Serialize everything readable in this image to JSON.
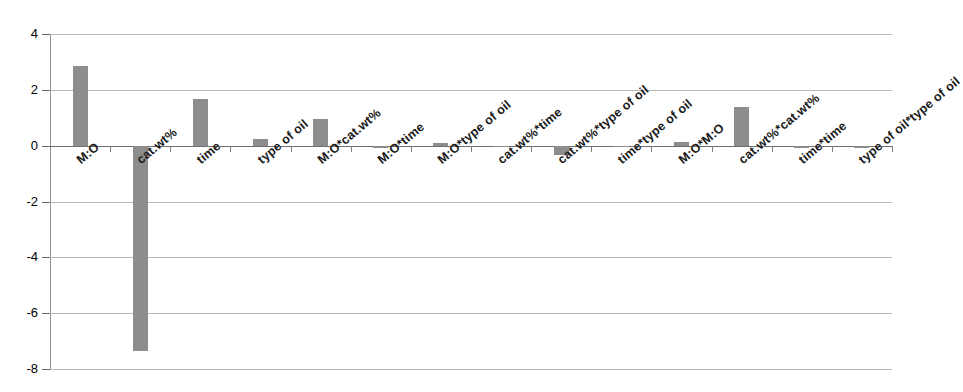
{
  "chart_data": {
    "type": "bar",
    "title": "",
    "subtitle": "",
    "xlabel": "",
    "ylabel": "",
    "ylim": [
      -8,
      4
    ],
    "yticks": [
      4,
      2,
      0,
      -2,
      -4,
      -6,
      -8
    ],
    "ytick_labels": [
      "4",
      "2",
      "0",
      "-2",
      "-4",
      "-6",
      "-8"
    ],
    "grid": true,
    "legend": false,
    "orientation": "vertical",
    "bar_color": "#8d8d8d",
    "categories": [
      "M:O",
      "cat.wt%",
      "time",
      "type of oil",
      "M:O*cat.wt%",
      "M:O*time",
      "M:O*type of oil",
      "cat.wt%*time",
      "cat.wt%*type of oil",
      "time*type of oil",
      "M:O*M:O",
      "cat.wt%*cat.wt%",
      "time*time",
      "type of oil*type of oil"
    ],
    "values": [
      2.85,
      -7.35,
      1.68,
      0.23,
      0.96,
      -0.1,
      0.1,
      -0.05,
      -0.35,
      -0.05,
      0.12,
      1.37,
      -0.1,
      -0.1
    ]
  }
}
